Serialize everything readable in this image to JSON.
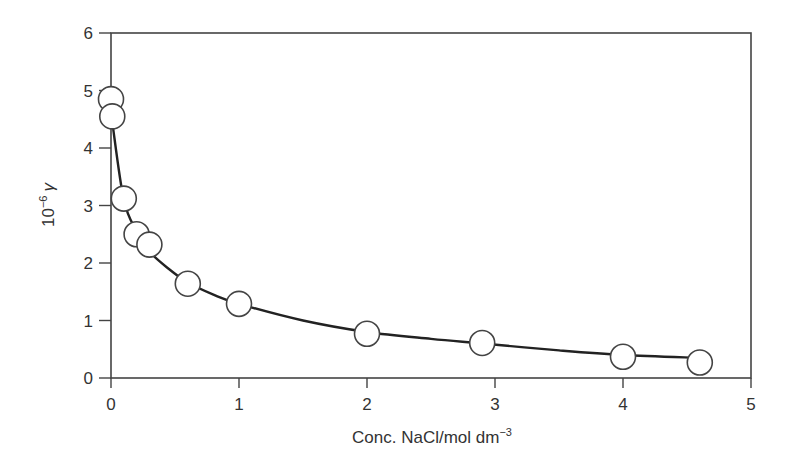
{
  "chart_data": {
    "type": "line",
    "title": "",
    "xlabel": "Conc. NaCl/mol dm",
    "xlabel_sup": "−3",
    "ylabel_prefix": "10",
    "ylabel_sup": "−6",
    "ylabel_symbol": "γ",
    "xlim": [
      0,
      5
    ],
    "ylim": [
      0,
      6
    ],
    "xticks": [
      0,
      1,
      2,
      3,
      4,
      5
    ],
    "yticks": [
      0,
      1,
      2,
      3,
      4,
      5,
      6
    ],
    "grid": false,
    "legend": null,
    "series": [
      {
        "name": "measured",
        "marker": "open-circle",
        "x": [
          0.0,
          0.01,
          0.1,
          0.2,
          0.3,
          0.6,
          1.0,
          2.0,
          2.9,
          4.0,
          4.6
        ],
        "y": [
          4.85,
          4.55,
          3.12,
          2.5,
          2.32,
          1.64,
          1.29,
          0.77,
          0.61,
          0.37,
          0.27
        ]
      }
    ],
    "fit_curve": {
      "x": [
        0.01,
        0.1,
        0.2,
        0.3,
        0.45,
        0.6,
        0.8,
        1.0,
        1.5,
        2.0,
        2.5,
        2.9,
        3.5,
        4.0,
        4.6
      ],
      "y": [
        4.45,
        3.1,
        2.55,
        2.2,
        1.9,
        1.66,
        1.45,
        1.29,
        1.0,
        0.8,
        0.68,
        0.6,
        0.48,
        0.4,
        0.35
      ]
    }
  }
}
